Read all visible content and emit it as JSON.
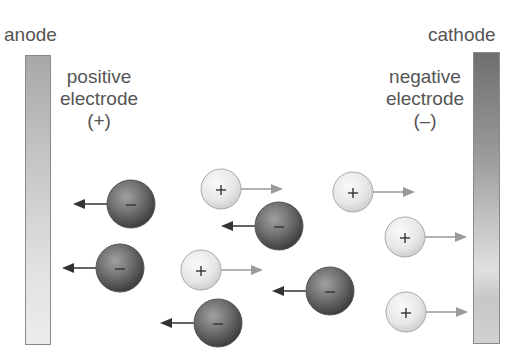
{
  "labels": {
    "anode": "anode",
    "cathode": "cathode",
    "anode_desc_1": "positive",
    "anode_desc_2": "electrode",
    "anode_sign": "(+)",
    "cathode_desc_1": "negative",
    "cathode_desc_2": "electrode",
    "cathode_sign": "(–)"
  },
  "colors": {
    "anion_fill": "#6a6a6a",
    "cation_fill": "#eeeeee",
    "arrow_dark": "#333333",
    "arrow_light": "#9a9a9a",
    "text": "#555555"
  },
  "ions": [
    {
      "type": "anion",
      "symbol": "–",
      "cx": 131,
      "cy": 204,
      "r": 24,
      "direction": "left"
    },
    {
      "type": "anion",
      "symbol": "–",
      "cx": 120,
      "cy": 268,
      "r": 24,
      "direction": "left"
    },
    {
      "type": "anion",
      "symbol": "–",
      "cx": 279,
      "cy": 226,
      "r": 24,
      "direction": "left"
    },
    {
      "type": "anion",
      "symbol": "–",
      "cx": 330,
      "cy": 291,
      "r": 24,
      "direction": "left"
    },
    {
      "type": "anion",
      "symbol": "–",
      "cx": 218,
      "cy": 323,
      "r": 24,
      "direction": "left"
    },
    {
      "type": "cation",
      "symbol": "+",
      "cx": 221,
      "cy": 189,
      "r": 20,
      "direction": "right"
    },
    {
      "type": "cation",
      "symbol": "+",
      "cx": 353,
      "cy": 192,
      "r": 20,
      "direction": "right"
    },
    {
      "type": "cation",
      "symbol": "+",
      "cx": 405,
      "cy": 237,
      "r": 20,
      "direction": "right"
    },
    {
      "type": "cation",
      "symbol": "+",
      "cx": 201,
      "cy": 270,
      "r": 20,
      "direction": "right"
    },
    {
      "type": "cation",
      "symbol": "+",
      "cx": 406,
      "cy": 312,
      "r": 20,
      "direction": "right"
    }
  ]
}
